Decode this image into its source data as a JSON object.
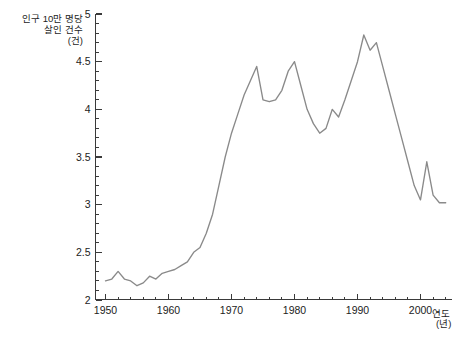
{
  "chart_data": {
    "type": "line",
    "title": "",
    "subtitle": "",
    "xlabel": "연도 (년)",
    "ylabel": "인구 10만 명당 살인 건수 (건)",
    "ylabel_lines": [
      "인구 10만 명당",
      "살인 건수",
      "(건)"
    ],
    "xlabel_lines": [
      "연도",
      "(년)"
    ],
    "xlim": [
      1950,
      2005
    ],
    "ylim": [
      2,
      5
    ],
    "grid": false,
    "legend": null,
    "line_color": "#8a8a8a",
    "axis_color": "#3a3a3a",
    "x_ticks_major": [
      1950,
      1960,
      1970,
      1980,
      1990,
      2000
    ],
    "x_tick_labels": [
      "1950",
      "1960",
      "1970",
      "1980",
      "1990",
      "2000"
    ],
    "x_tick_minor_step": 2,
    "y_ticks_major": [
      2,
      2.5,
      3,
      3.5,
      4,
      4.5,
      5
    ],
    "y_tick_labels": [
      "2",
      "2.5",
      "3",
      "3.5",
      "4",
      "4.5",
      "5"
    ],
    "y_tick_minor_step": 0.1,
    "series": [
      {
        "name": "인구 10만 명당 살인 건수",
        "color": "#8a8a8a",
        "x": [
          1950,
          1951,
          1952,
          1953,
          1954,
          1955,
          1956,
          1957,
          1958,
          1959,
          1960,
          1961,
          1962,
          1963,
          1964,
          1965,
          1966,
          1967,
          1968,
          1969,
          1970,
          1971,
          1972,
          1973,
          1974,
          1975,
          1976,
          1977,
          1978,
          1979,
          1980,
          1981,
          1982,
          1983,
          1984,
          1985,
          1986,
          1987,
          1988,
          1989,
          1990,
          1991,
          1992,
          1993,
          1994,
          1995,
          1996,
          1997,
          1998,
          1999,
          2000,
          2001,
          2002,
          2003,
          2004
        ],
        "values": [
          2.2,
          2.22,
          2.3,
          2.22,
          2.2,
          2.15,
          2.18,
          2.25,
          2.22,
          2.28,
          2.3,
          2.32,
          2.36,
          2.4,
          2.5,
          2.55,
          2.7,
          2.9,
          3.2,
          3.5,
          3.75,
          3.95,
          4.15,
          4.3,
          4.45,
          4.1,
          4.08,
          4.1,
          4.2,
          4.4,
          4.5,
          4.25,
          4.0,
          3.85,
          3.75,
          3.8,
          4.0,
          3.92,
          4.1,
          4.3,
          4.5,
          4.78,
          4.62,
          4.7,
          4.45,
          4.2,
          3.95,
          3.7,
          3.45,
          3.2,
          3.05,
          3.45,
          3.1,
          3.02,
          3.02
        ]
      }
    ]
  },
  "axis": {
    "y_label_line1": "인구 10만 명당",
    "y_label_line2": "살인 건수",
    "y_label_line3": "(건)",
    "x_label_line1": "연도",
    "x_label_line2": "(년)"
  }
}
